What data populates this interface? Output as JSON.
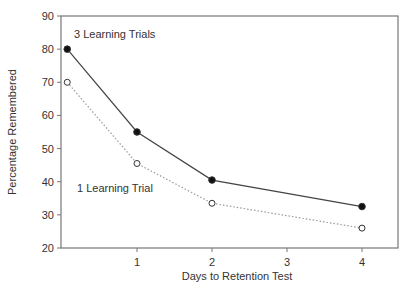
{
  "chart_data": {
    "type": "line",
    "title": "",
    "xlabel": "Days to Retention Test",
    "ylabel": "Percentage Remembered",
    "xlim": [
      0,
      4.5
    ],
    "ylim": [
      20,
      90
    ],
    "x_ticks": [
      1,
      2,
      3,
      4
    ],
    "y_ticks": [
      20,
      30,
      40,
      50,
      60,
      70,
      80,
      90
    ],
    "grid": false,
    "legend": "inline annotations",
    "series": [
      {
        "name": "3 Learning Trials",
        "marker": "filled-circle",
        "line": "solid",
        "x": [
          0.07,
          1,
          2,
          4
        ],
        "values": [
          80,
          55,
          40.5,
          32.5
        ]
      },
      {
        "name": "1 Learning Trial",
        "marker": "open-circle",
        "line": "dotted",
        "x": [
          0.07,
          1,
          2,
          4
        ],
        "values": [
          70,
          45.5,
          33.5,
          26
        ]
      }
    ],
    "annotations": [
      {
        "text": "3 Learning Trials",
        "near_series": 0
      },
      {
        "text": "1 Learning Trial",
        "near_series": 1
      }
    ]
  },
  "labels": {
    "x_axis": "Days to Retention Test",
    "y_axis": "Percentage Remembered",
    "series0": "3 Learning Trials",
    "series1": "1 Learning Trial"
  }
}
